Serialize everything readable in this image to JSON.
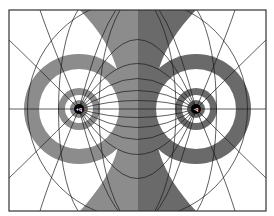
{
  "figure": {
    "type": "electric-dipole-field-map",
    "colors": {
      "background": "#ffffff",
      "left_gray": "#8c8c8c",
      "right_gray": "#6a6a6a",
      "line": "#1a1a1a",
      "frame": "#333333"
    },
    "charges": [
      {
        "id": "left",
        "label": "+q",
        "x": 79,
        "y": 109
      },
      {
        "id": "right",
        "label": "-q",
        "x": 196,
        "y": 109
      }
    ]
  }
}
